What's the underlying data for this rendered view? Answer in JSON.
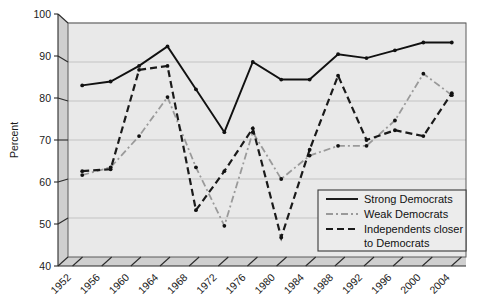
{
  "chart_data": {
    "type": "line",
    "title": "",
    "xlabel": "",
    "ylabel": "Percent",
    "ylim": [
      40,
      100
    ],
    "yticks": [
      40,
      50,
      60,
      70,
      80,
      90,
      100
    ],
    "grid": true,
    "legend_position": "bottom-right",
    "categories": [
      "1952",
      "1956",
      "1960",
      "1964",
      "1968",
      "1972",
      "1976",
      "1980",
      "1984",
      "1988",
      "1992",
      "1996",
      "2000",
      "2004"
    ],
    "series": [
      {
        "name": "Strong Democrats",
        "style": "solid",
        "color": "#111111",
        "values": [
          84,
          85,
          89,
          94,
          83,
          72,
          90,
          85.5,
          85.5,
          92,
          91,
          93,
          95,
          95
        ]
      },
      {
        "name": "Weak Democrats",
        "style": "dash-dot",
        "color": "#9a9a9a",
        "values": [
          61,
          63,
          71,
          81,
          63,
          48,
          72,
          60,
          66,
          68.5,
          68.5,
          75,
          87,
          81.5
        ]
      },
      {
        "name": "Independents closer to Democrats",
        "style": "dashed",
        "color": "#1a1a1a",
        "values": [
          62,
          62.5,
          88,
          89,
          52,
          62,
          73,
          45,
          67.5,
          86.5,
          70,
          72.5,
          71,
          82
        ]
      }
    ]
  },
  "legend": {
    "entries": [
      {
        "label": "Strong Democrats"
      },
      {
        "label": "Weak Democrats"
      },
      {
        "label": "Independents closer"
      },
      {
        "label": "to Democrats"
      }
    ]
  }
}
